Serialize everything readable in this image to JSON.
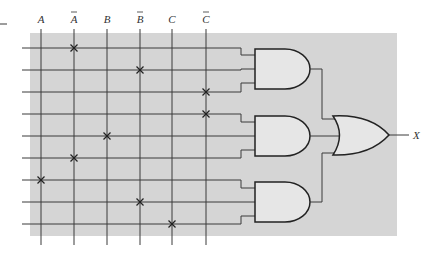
{
  "diagram": {
    "type": "PLA logic diagram (AND-OR array)",
    "background_color": "#d5d5d5",
    "inputs": [
      {
        "label": "A",
        "bar": false,
        "x": 41
      },
      {
        "label": "A",
        "bar": true,
        "x": 74
      },
      {
        "label": "B",
        "bar": false,
        "x": 107
      },
      {
        "label": "B",
        "bar": true,
        "x": 140
      },
      {
        "label": "C",
        "bar": false,
        "x": 172
      },
      {
        "label": "C",
        "bar": true,
        "x": 206
      }
    ],
    "rows_y": [
      48,
      70,
      92,
      114,
      136,
      158,
      180,
      202,
      224
    ],
    "connections": [
      {
        "row": 0,
        "input": 1
      },
      {
        "row": 1,
        "input": 3
      },
      {
        "row": 2,
        "input": 5
      },
      {
        "row": 3,
        "input": 5
      },
      {
        "row": 4,
        "input": 2
      },
      {
        "row": 5,
        "input": 1
      },
      {
        "row": 6,
        "input": 0
      },
      {
        "row": 7,
        "input": 3
      },
      {
        "row": 8,
        "input": 4
      }
    ],
    "and_gates": [
      {
        "name": "AND1",
        "rows": [
          0,
          1,
          2
        ]
      },
      {
        "name": "AND2",
        "rows": [
          3,
          4,
          5
        ]
      },
      {
        "name": "AND3",
        "rows": [
          6,
          7,
          8
        ]
      }
    ],
    "or_gate": {
      "name": "OR1"
    },
    "output": {
      "label": "X"
    }
  }
}
